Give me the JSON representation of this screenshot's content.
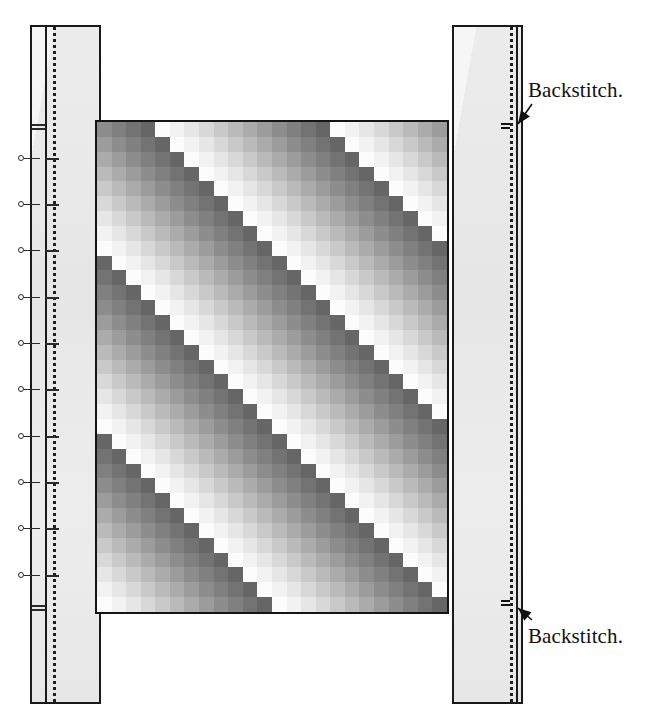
{
  "figure": {
    "kind": "sewing-construction-diagram",
    "background_color": "#ffffff",
    "width": 653,
    "height": 720
  },
  "annotations": [
    {
      "id": "backstitch-top",
      "text": "Backstitch.",
      "x": 528,
      "y": 78,
      "arrow_to_x": 518,
      "arrow_to_y": 124
    },
    {
      "id": "backstitch-bottom",
      "text": "Backstitch.",
      "x": 528,
      "y": 624,
      "arrow_to_x": 518,
      "arrow_to_y": 608
    }
  ],
  "strips": [
    {
      "id": "left-border-strip",
      "name": "left strip",
      "x": 30,
      "y": 25,
      "width": 71,
      "height": 679,
      "fabric_color": "#e9e9e9",
      "outline_color": "#1a1a1a",
      "seam_solid_offset": 13,
      "seam_dotted_offset": 21,
      "stitch_style": "dotted"
    },
    {
      "id": "right-border-strip",
      "name": "right strip",
      "x": 452,
      "y": 25,
      "width": 71,
      "height": 679,
      "fabric_color": "#e9e9e9",
      "outline_color": "#1a1a1a",
      "seam_solid_offset": 62,
      "seam_dotted_offset": 56,
      "stitch_style": "dotted"
    }
  ],
  "pins": {
    "name": "pin markers along left seam",
    "strip_x": 30,
    "head_offset_x": -12,
    "shaft_length": 22,
    "tick_offset_x": 15,
    "tick_length": 14,
    "positions_y": [
      158,
      204,
      250,
      297,
      343,
      389,
      436,
      482,
      528,
      575
    ],
    "extra_ticks_y": [
      124,
      128,
      605,
      609
    ]
  },
  "panel": {
    "id": "pieced-panel",
    "name": "pieced gradient panel",
    "x": 95,
    "y": 120,
    "width": 354,
    "height": 494,
    "outline_color": "#141414",
    "columns": 24,
    "rows": 33,
    "patch_size": 14.75,
    "palette": [
      "#fcfcfc",
      "#f2f2f2",
      "#e6e6e6",
      "#d8d8d8",
      "#c9c9c9",
      "#bababa",
      "#ababab",
      "#9c9c9c",
      "#8d8d8d",
      "#808080",
      "#737373",
      "#666666"
    ],
    "pattern": {
      "type": "diagonal-gradient-bands",
      "band_period": 12,
      "slope": "down-right",
      "description": "Each diagonal band ramps light-to-dark then resets; bands step one column per row."
    }
  },
  "chart_data": {
    "type": "heatmap",
    "title": "",
    "xlabel": "",
    "ylabel": "",
    "columns": 24,
    "rows": 33,
    "legend": [],
    "note": "Gray value index per patch; 0 = lightest, 11 = darkest.",
    "values": [
      [
        8,
        9,
        10,
        11,
        0,
        1,
        2,
        3,
        4,
        5,
        6,
        7,
        8,
        9,
        10,
        11,
        0,
        1,
        2,
        3,
        4,
        5,
        6,
        7
      ],
      [
        7,
        8,
        9,
        10,
        11,
        0,
        1,
        2,
        3,
        4,
        5,
        6,
        7,
        8,
        9,
        10,
        11,
        0,
        1,
        2,
        3,
        4,
        5,
        6
      ],
      [
        6,
        7,
        8,
        9,
        10,
        11,
        0,
        1,
        2,
        3,
        4,
        5,
        6,
        7,
        8,
        9,
        10,
        11,
        0,
        1,
        2,
        3,
        4,
        5
      ],
      [
        5,
        6,
        7,
        8,
        9,
        10,
        11,
        0,
        1,
        2,
        3,
        4,
        5,
        6,
        7,
        8,
        9,
        10,
        11,
        0,
        1,
        2,
        3,
        4
      ],
      [
        4,
        5,
        6,
        7,
        8,
        9,
        10,
        11,
        0,
        1,
        2,
        3,
        4,
        5,
        6,
        7,
        8,
        9,
        10,
        11,
        0,
        1,
        2,
        3
      ],
      [
        3,
        4,
        5,
        6,
        7,
        8,
        9,
        10,
        11,
        0,
        1,
        2,
        3,
        4,
        5,
        6,
        7,
        8,
        9,
        10,
        11,
        0,
        1,
        2
      ],
      [
        2,
        3,
        4,
        5,
        6,
        7,
        8,
        9,
        10,
        11,
        0,
        1,
        2,
        3,
        4,
        5,
        6,
        7,
        8,
        9,
        10,
        11,
        0,
        1
      ],
      [
        1,
        2,
        3,
        4,
        5,
        6,
        7,
        8,
        9,
        10,
        11,
        0,
        1,
        2,
        3,
        4,
        5,
        6,
        7,
        8,
        9,
        10,
        11,
        0
      ],
      [
        0,
        1,
        2,
        3,
        4,
        5,
        6,
        7,
        8,
        9,
        10,
        11,
        0,
        1,
        2,
        3,
        4,
        5,
        6,
        7,
        8,
        9,
        10,
        11
      ],
      [
        11,
        0,
        1,
        2,
        3,
        4,
        5,
        6,
        7,
        8,
        9,
        10,
        11,
        0,
        1,
        2,
        3,
        4,
        5,
        6,
        7,
        8,
        9,
        10
      ],
      [
        10,
        11,
        0,
        1,
        2,
        3,
        4,
        5,
        6,
        7,
        8,
        9,
        10,
        11,
        0,
        1,
        2,
        3,
        4,
        5,
        6,
        7,
        8,
        9
      ],
      [
        9,
        10,
        11,
        0,
        1,
        2,
        3,
        4,
        5,
        6,
        7,
        8,
        9,
        10,
        11,
        0,
        1,
        2,
        3,
        4,
        5,
        6,
        7,
        8
      ],
      [
        8,
        9,
        10,
        11,
        0,
        1,
        2,
        3,
        4,
        5,
        6,
        7,
        8,
        9,
        10,
        11,
        0,
        1,
        2,
        3,
        4,
        5,
        6,
        7
      ],
      [
        7,
        8,
        9,
        10,
        11,
        0,
        1,
        2,
        3,
        4,
        5,
        6,
        7,
        8,
        9,
        10,
        11,
        0,
        1,
        2,
        3,
        4,
        5,
        6
      ],
      [
        6,
        7,
        8,
        9,
        10,
        11,
        0,
        1,
        2,
        3,
        4,
        5,
        6,
        7,
        8,
        9,
        10,
        11,
        0,
        1,
        2,
        3,
        4,
        5
      ],
      [
        5,
        6,
        7,
        8,
        9,
        10,
        11,
        0,
        1,
        2,
        3,
        4,
        5,
        6,
        7,
        8,
        9,
        10,
        11,
        0,
        1,
        2,
        3,
        4
      ],
      [
        4,
        5,
        6,
        7,
        8,
        9,
        10,
        11,
        0,
        1,
        2,
        3,
        4,
        5,
        6,
        7,
        8,
        9,
        10,
        11,
        0,
        1,
        2,
        3
      ],
      [
        3,
        4,
        5,
        6,
        7,
        8,
        9,
        10,
        11,
        0,
        1,
        2,
        3,
        4,
        5,
        6,
        7,
        8,
        9,
        10,
        11,
        0,
        1,
        2
      ],
      [
        2,
        3,
        4,
        5,
        6,
        7,
        8,
        9,
        10,
        11,
        0,
        1,
        2,
        3,
        4,
        5,
        6,
        7,
        8,
        9,
        10,
        11,
        0,
        1
      ],
      [
        1,
        2,
        3,
        4,
        5,
        6,
        7,
        8,
        9,
        10,
        11,
        0,
        1,
        2,
        3,
        4,
        5,
        6,
        7,
        8,
        9,
        10,
        11,
        0
      ],
      [
        0,
        1,
        2,
        3,
        4,
        5,
        6,
        7,
        8,
        9,
        10,
        11,
        0,
        1,
        2,
        3,
        4,
        5,
        6,
        7,
        8,
        9,
        10,
        11
      ],
      [
        11,
        0,
        1,
        2,
        3,
        4,
        5,
        6,
        7,
        8,
        9,
        10,
        11,
        0,
        1,
        2,
        3,
        4,
        5,
        6,
        7,
        8,
        9,
        10
      ],
      [
        10,
        11,
        0,
        1,
        2,
        3,
        4,
        5,
        6,
        7,
        8,
        9,
        10,
        11,
        0,
        1,
        2,
        3,
        4,
        5,
        6,
        7,
        8,
        9
      ],
      [
        9,
        10,
        11,
        0,
        1,
        2,
        3,
        4,
        5,
        6,
        7,
        8,
        9,
        10,
        11,
        0,
        1,
        2,
        3,
        4,
        5,
        6,
        7,
        8
      ],
      [
        8,
        9,
        10,
        11,
        0,
        1,
        2,
        3,
        4,
        5,
        6,
        7,
        8,
        9,
        10,
        11,
        0,
        1,
        2,
        3,
        4,
        5,
        6,
        7
      ],
      [
        7,
        8,
        9,
        10,
        11,
        0,
        1,
        2,
        3,
        4,
        5,
        6,
        7,
        8,
        9,
        10,
        11,
        0,
        1,
        2,
        3,
        4,
        5,
        6
      ],
      [
        6,
        7,
        8,
        9,
        10,
        11,
        0,
        1,
        2,
        3,
        4,
        5,
        6,
        7,
        8,
        9,
        10,
        11,
        0,
        1,
        2,
        3,
        4,
        5
      ],
      [
        5,
        6,
        7,
        8,
        9,
        10,
        11,
        0,
        1,
        2,
        3,
        4,
        5,
        6,
        7,
        8,
        9,
        10,
        11,
        0,
        1,
        2,
        3,
        4
      ],
      [
        4,
        5,
        6,
        7,
        8,
        9,
        10,
        11,
        0,
        1,
        2,
        3,
        4,
        5,
        6,
        7,
        8,
        9,
        10,
        11,
        0,
        1,
        2,
        3
      ],
      [
        3,
        4,
        5,
        6,
        7,
        8,
        9,
        10,
        11,
        0,
        1,
        2,
        3,
        4,
        5,
        6,
        7,
        8,
        9,
        10,
        11,
        0,
        1,
        2
      ],
      [
        2,
        3,
        4,
        5,
        6,
        7,
        8,
        9,
        10,
        11,
        0,
        1,
        2,
        3,
        4,
        5,
        6,
        7,
        8,
        9,
        10,
        11,
        0,
        1
      ],
      [
        1,
        2,
        3,
        4,
        5,
        6,
        7,
        8,
        9,
        10,
        11,
        0,
        1,
        2,
        3,
        4,
        5,
        6,
        7,
        8,
        9,
        10,
        11,
        0
      ],
      [
        0,
        1,
        2,
        3,
        4,
        5,
        6,
        7,
        8,
        9,
        10,
        11,
        0,
        1,
        2,
        3,
        4,
        5,
        6,
        7,
        8,
        9,
        10,
        11
      ]
    ]
  }
}
